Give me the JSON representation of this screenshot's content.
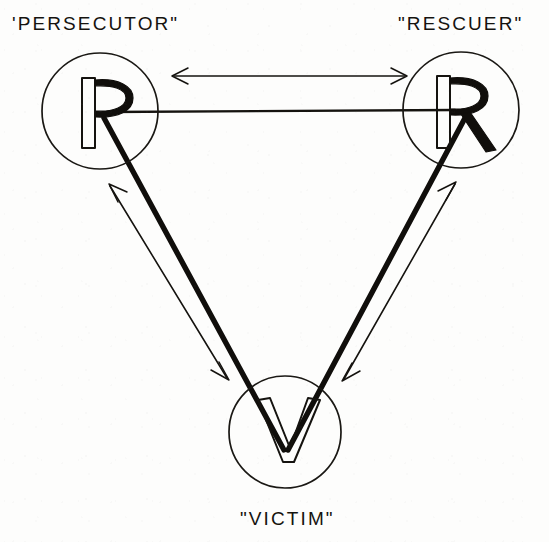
{
  "diagram": {
    "kind": "drama-triangle",
    "background_color": "#fdfdfc",
    "ink_color": "#15130f",
    "nodes": [
      {
        "id": "persecutor",
        "letter": "P",
        "label": "'PERSECUTOR\"",
        "label_x": 12,
        "label_y": 30,
        "center_x": 100,
        "center_y": 111,
        "radius": 58
      },
      {
        "id": "rescuer",
        "letter": "R",
        "label": "\"RESCUER\"",
        "label_x": 398,
        "label_y": 30,
        "center_x": 461,
        "center_y": 110,
        "radius": 58
      },
      {
        "id": "victim",
        "letter": "V",
        "label": "\"VICTIM\"",
        "label_x": 240,
        "label_y": 525,
        "center_x": 285,
        "center_y": 432,
        "radius": 56
      }
    ],
    "thick_links": [
      {
        "id": "persecutor-rescuer",
        "from": "persecutor",
        "to": "rescuer"
      },
      {
        "id": "persecutor-victim",
        "from": "persecutor",
        "to": "victim"
      },
      {
        "id": "rescuer-victim",
        "from": "rescuer",
        "to": "victim"
      }
    ],
    "double_arrows": [
      {
        "id": "arrow-persecutor-rescuer",
        "between": "persecutor-rescuer",
        "orientation": "horizontal"
      },
      {
        "id": "arrow-persecutor-victim",
        "between": "persecutor-victim",
        "orientation": "diagonal-left"
      },
      {
        "id": "arrow-rescuer-victim",
        "between": "rescuer-victim",
        "orientation": "diagonal-right"
      }
    ]
  }
}
